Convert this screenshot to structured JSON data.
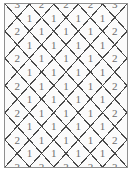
{
  "figure": {
    "title": "",
    "kind": "diamond-lattice-number-grid",
    "border_color": "#8f8f8f",
    "line_color": "#4a4a4a",
    "digit_color": "#6e6e6e",
    "background_color": "#fbfbfb"
  },
  "chart_data": {
    "type": "heatmap",
    "title": "",
    "xlabel": "",
    "ylabel": "",
    "legend": [],
    "grid": true,
    "rows": [
      {
        "kind": "main",
        "values": [
          "3",
          "2",
          "2",
          "2",
          "3"
        ]
      },
      {
        "kind": "offset",
        "values": [
          "1",
          "1",
          "1",
          "1"
        ]
      },
      {
        "kind": "main",
        "values": [
          "2",
          "1",
          "1",
          "1",
          "2"
        ]
      },
      {
        "kind": "offset",
        "values": [
          "1",
          "1",
          "1",
          "1"
        ]
      },
      {
        "kind": "main",
        "values": [
          "2",
          "1",
          "1",
          "1",
          "2"
        ]
      },
      {
        "kind": "offset",
        "values": [
          "1",
          "1",
          "1",
          "1"
        ]
      },
      {
        "kind": "main",
        "values": [
          "2",
          "1",
          "1",
          "1",
          "2"
        ]
      },
      {
        "kind": "offset",
        "values": [
          "1",
          "1",
          "1",
          "1"
        ]
      },
      {
        "kind": "main",
        "values": [
          "2",
          "1",
          "1",
          "1",
          "2"
        ]
      },
      {
        "kind": "offset",
        "values": [
          "1",
          "1",
          "1",
          "1"
        ]
      },
      {
        "kind": "main",
        "values": [
          "2",
          "1",
          "1",
          "1",
          "2"
        ]
      },
      {
        "kind": "offset",
        "values": [
          "1",
          "1",
          "1",
          "1"
        ]
      },
      {
        "kind": "main",
        "values": [
          "3",
          "2",
          "2",
          "2",
          "3"
        ]
      }
    ],
    "corner_value": "3",
    "edge_value": "2",
    "interior_value": "1"
  }
}
